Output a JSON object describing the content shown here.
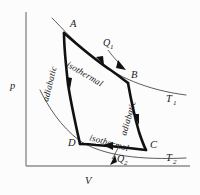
{
  "figure": {
    "type": "carnot-cycle-pv-diagram",
    "background_color": "#fcfcfc",
    "curve_color": "#111111",
    "axis_color": "#8d8d8d"
  },
  "axes": {
    "y_label": "p",
    "x_label": "V",
    "x_axis_y": 166,
    "y_axis_x": 26
  },
  "points": [
    {
      "id": "A",
      "label": "A",
      "x": 64,
      "y": 33,
      "label_x": 70,
      "label_y": 27
    },
    {
      "id": "B",
      "label": "B",
      "x": 128,
      "y": 83,
      "label_x": 131,
      "label_y": 77
    },
    {
      "id": "C",
      "label": "C",
      "x": 146,
      "y": 150,
      "label_x": 150,
      "label_y": 147
    },
    {
      "id": "D",
      "label": "D",
      "x": 80,
      "y": 144,
      "label_x": 73,
      "label_y": 144
    }
  ],
  "processes": [
    {
      "id": "ab",
      "label": "isothermal",
      "from": "A",
      "to": "B",
      "rotation": 31,
      "x": 66,
      "y": 66
    },
    {
      "id": "bc",
      "label": "adiabatic",
      "from": "B",
      "to": "C",
      "rotation": -74,
      "x": 126,
      "y": 136
    },
    {
      "id": "cd",
      "label": "isothermal",
      "from": "C",
      "to": "D",
      "rotation": 16,
      "x": 89,
      "y": 140
    },
    {
      "id": "da",
      "label": "adiabatic",
      "from": "D",
      "to": "A",
      "rotation": -76,
      "x": 48,
      "y": 102
    }
  ],
  "isotherms": [
    {
      "id": "T1",
      "label": "T",
      "subscript": "1",
      "label_x": 169,
      "label_y": 99
    },
    {
      "id": "T2",
      "label": "T",
      "subscript": "2",
      "label_x": 169,
      "label_y": 158
    }
  ],
  "heat_flows": [
    {
      "id": "Q1",
      "label": "Q",
      "subscript": "1",
      "label_x": 106,
      "label_y": 44,
      "direction": "into-system"
    },
    {
      "id": "Q2",
      "label": "Q",
      "subscript": "2",
      "label_x": 119,
      "label_y": 166,
      "direction": "out-of-system"
    }
  ]
}
